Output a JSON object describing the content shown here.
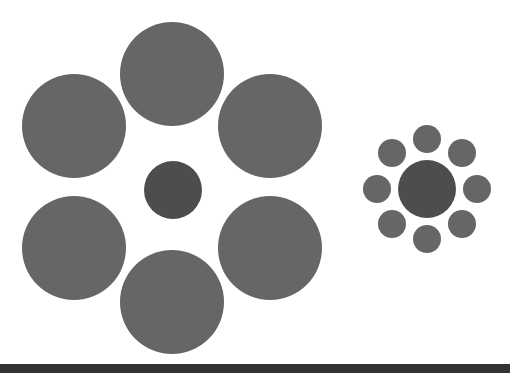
{
  "figure": {
    "name": "Ebbinghaus illusion",
    "colors": {
      "surround": "#666666",
      "center": "#4d4d4d",
      "background": "#ffffff",
      "bottom_bar": "#333333"
    },
    "left_cluster": {
      "center": {
        "x": 173,
        "y": 190,
        "r": 29
      },
      "surround_r": 52,
      "surround": [
        [
          172,
          74
        ],
        [
          74,
          126
        ],
        [
          270,
          126
        ],
        [
          74,
          248
        ],
        [
          270,
          248
        ],
        [
          172,
          302
        ]
      ]
    },
    "right_cluster": {
      "center": {
        "x": 427,
        "y": 189,
        "r": 29
      },
      "surround_r": 14,
      "surround": [
        [
          427,
          139
        ],
        [
          392,
          153
        ],
        [
          462,
          153
        ],
        [
          377,
          189
        ],
        [
          477,
          189
        ],
        [
          392,
          224
        ],
        [
          462,
          224
        ],
        [
          427,
          239
        ]
      ]
    }
  }
}
